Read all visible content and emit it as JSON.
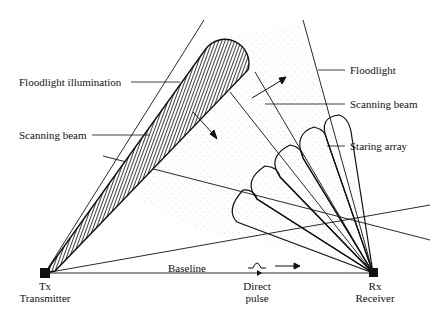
{
  "diagram": {
    "labels": {
      "floodlight_illumination": "Floodlight illumination",
      "scanning_beam_left": "Scanning beam",
      "floodlight": "Floodlight",
      "scanning_beam_right": "Scanning beam",
      "staring_array": "Staring array",
      "baseline": "Baseline",
      "direct_pulse_line1": "Direct",
      "direct_pulse_line2": "pulse",
      "tx_abbr": "Tx",
      "tx_name": "Transmitter",
      "rx_abbr": "Rx",
      "rx_name": "Receiver"
    },
    "nodes": [
      {
        "id": "tx",
        "label": "Tx",
        "name": "Transmitter",
        "x": 45,
        "y": 273
      },
      {
        "id": "rx",
        "label": "Rx",
        "name": "Receiver",
        "x": 373,
        "y": 273
      }
    ],
    "staring_array_lobe_count": 5,
    "colors": {
      "ink": "#111111",
      "stipple": "#9a9a9a",
      "background": "#ffffff"
    }
  }
}
